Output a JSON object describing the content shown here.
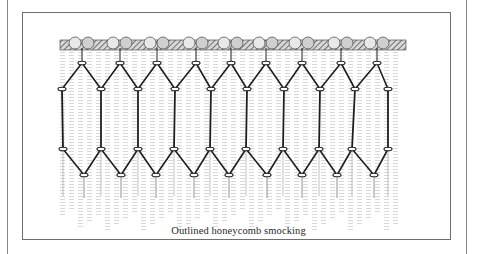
{
  "figure": {
    "caption": "Outlined honeycomb smocking",
    "illustration": "outlined-honeycomb-smocking-drawing",
    "colors": {
      "ink": "#1e1e1e",
      "frame": "#6e6e6e",
      "shading": "#9a9a9a",
      "background": "#ffffff"
    },
    "stitch_rows": {
      "top_knots_y": 63,
      "top_knots_x": [
        82,
        120,
        157,
        196,
        231,
        266,
        302,
        341,
        377
      ],
      "upper_points_y": 89,
      "upper_points_x": [
        62,
        101,
        138,
        175,
        211,
        247,
        284,
        320,
        355,
        388
      ],
      "lower_points_y": 149,
      "lower_points_x": [
        63,
        101,
        138,
        174,
        210,
        246,
        283,
        319,
        352,
        388
      ],
      "bottom_knots_y": 175,
      "bottom_knots_x": [
        84,
        121,
        156,
        194,
        229,
        267,
        302,
        337,
        374
      ]
    }
  }
}
